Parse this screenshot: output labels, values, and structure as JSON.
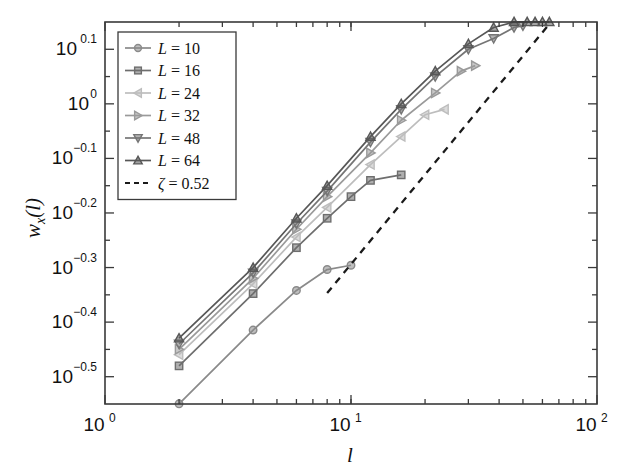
{
  "chart_data": {
    "type": "line",
    "title": "",
    "xlabel": "l",
    "ylabel": "w_x (l)",
    "xscale": "log",
    "yscale": "log",
    "xlim": [
      1,
      100
    ],
    "ylim": [
      0.2818,
      1.4125
    ],
    "grid": false,
    "legend_position": "upper-left",
    "xticks": [
      {
        "value": 1,
        "label": "10",
        "exp": "0"
      },
      {
        "value": 10,
        "label": "10",
        "exp": "1"
      },
      {
        "value": 100,
        "label": "10",
        "exp": "2"
      }
    ],
    "yticks": [
      {
        "value": 1.2589,
        "label": "10",
        "exp": "0.1"
      },
      {
        "value": 1.0,
        "label": "10",
        "exp": "0"
      },
      {
        "value": 0.7943,
        "label": "10",
        "exp": "-0.1"
      },
      {
        "value": 0.631,
        "label": "10",
        "exp": "-0.2"
      },
      {
        "value": 0.5012,
        "label": "10",
        "exp": "-0.3"
      },
      {
        "value": 0.3981,
        "label": "10",
        "exp": "-0.4"
      },
      {
        "value": 0.3162,
        "label": "10",
        "exp": "-0.5"
      }
    ],
    "series": [
      {
        "name": "L = 10",
        "label_prefix": "L",
        "label_value": "10",
        "marker": "circle",
        "color": "#8a8a8a",
        "x": [
          2,
          4,
          6,
          8,
          10
        ],
        "y": [
          0.282,
          0.385,
          0.455,
          0.497,
          0.506
        ]
      },
      {
        "name": "L = 16",
        "label_prefix": "L",
        "label_value": "16",
        "marker": "square",
        "color": "#6e6e6e",
        "x": [
          2,
          4,
          6,
          8,
          10,
          12,
          16
        ],
        "y": [
          0.331,
          0.449,
          0.545,
          0.617,
          0.676,
          0.724,
          0.741
        ]
      },
      {
        "name": "L = 24",
        "label_prefix": "L",
        "label_value": "24",
        "marker": "triangle-left",
        "color": "#bdbdbd",
        "x": [
          2,
          4,
          6,
          8,
          12,
          16,
          20,
          24
        ],
        "y": [
          0.347,
          0.468,
          0.57,
          0.646,
          0.774,
          0.871,
          0.955,
          0.977
        ]
      },
      {
        "name": "L = 32",
        "label_prefix": "L",
        "label_value": "32",
        "marker": "triangle-right",
        "color": "#9a9a9a",
        "x": [
          2,
          4,
          6,
          8,
          12,
          16,
          22,
          28,
          32
        ],
        "y": [
          0.355,
          0.479,
          0.589,
          0.676,
          0.813,
          0.933,
          1.047,
          1.148,
          1.175
        ]
      },
      {
        "name": "L = 48",
        "label_prefix": "L",
        "label_value": "48",
        "marker": "triangle-down",
        "color": "#757575",
        "x": [
          2,
          4,
          6,
          8,
          12,
          16,
          22,
          30,
          38,
          46,
          50
        ],
        "y": [
          0.363,
          0.49,
          0.603,
          0.692,
          0.851,
          0.977,
          1.122,
          1.259,
          1.318,
          1.38,
          1.39
        ]
      },
      {
        "name": "L = 64",
        "label_prefix": "L",
        "label_value": "64",
        "marker": "triangle-up",
        "color": "#575757",
        "x": [
          2,
          4,
          6,
          8,
          12,
          16,
          22,
          30,
          38,
          46,
          52,
          56,
          60,
          64
        ],
        "y": [
          0.372,
          0.501,
          0.617,
          0.708,
          0.871,
          1.0,
          1.148,
          1.288,
          1.38,
          1.413,
          1.413,
          1.413,
          1.413,
          1.413
        ]
      }
    ],
    "reference_line": {
      "name": "zeta = 0.52",
      "label_symbol": "ζ",
      "label_value": "0.52",
      "style": "dashed",
      "color": "#1a1a1a",
      "exponent": 0.52,
      "x": [
        8,
        64
      ],
      "y": [
        0.45,
        1.4
      ]
    },
    "legend_entries": [
      {
        "symbol": "L",
        "value": "10",
        "marker": "circle",
        "color": "#8a8a8a"
      },
      {
        "symbol": "L",
        "value": "16",
        "marker": "square",
        "color": "#6e6e6e"
      },
      {
        "symbol": "L",
        "value": "24",
        "marker": "triangle-left",
        "color": "#bdbdbd"
      },
      {
        "symbol": "L",
        "value": "32",
        "marker": "triangle-right",
        "color": "#9a9a9a"
      },
      {
        "symbol": "L",
        "value": "48",
        "marker": "triangle-down",
        "color": "#757575"
      },
      {
        "symbol": "L",
        "value": "64",
        "marker": "triangle-up",
        "color": "#575757"
      },
      {
        "symbol": "ζ",
        "value": "0.52",
        "marker": "dashed",
        "color": "#1a1a1a"
      }
    ]
  },
  "axis": {
    "y_label_main": "w",
    "y_label_sub": "x",
    "y_label_arg": "(l)",
    "x_label": "l"
  }
}
